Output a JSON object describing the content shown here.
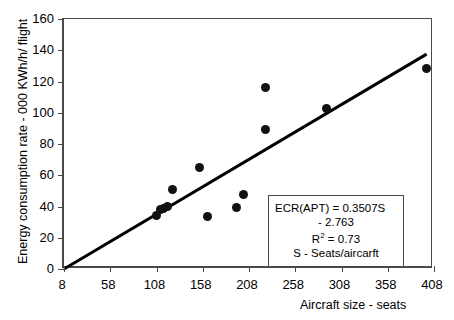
{
  "chart_data": {
    "type": "scatter",
    "title": "",
    "xlabel": "Aircraft size - seats",
    "ylabel": "Energy consumption  rate - 000 KWh/h/ flight",
    "xlim": [
      8,
      408
    ],
    "ylim": [
      0,
      160
    ],
    "xticks": [
      8,
      58,
      108,
      158,
      208,
      258,
      308,
      358,
      408
    ],
    "yticks": [
      0,
      20,
      40,
      60,
      80,
      100,
      120,
      140,
      160
    ],
    "grid": false,
    "legend": "none",
    "marker_color": "#111111",
    "line_color": "#000000",
    "frame_color": "#4a4a4a",
    "points": [
      {
        "x": 108,
        "y": 34.5
      },
      {
        "x": 112,
        "y": 38.0
      },
      {
        "x": 116,
        "y": 38.5
      },
      {
        "x": 120,
        "y": 40.0
      },
      {
        "x": 125,
        "y": 51.0
      },
      {
        "x": 155,
        "y": 65.0
      },
      {
        "x": 163,
        "y": 33.5
      },
      {
        "x": 195,
        "y": 39.5
      },
      {
        "x": 202,
        "y": 48.0
      },
      {
        "x": 226,
        "y": 116.0
      },
      {
        "x": 226,
        "y": 89.0
      },
      {
        "x": 292,
        "y": 103.0
      },
      {
        "x": 400,
        "y": 128.5
      }
    ],
    "trendline": {
      "slope": 0.3507,
      "intercept": -2.763,
      "x_start": 8,
      "x_end": 400
    },
    "annotation": {
      "line1": "ECR(APT) = 0.3507S",
      "line2": "- 2.763",
      "line3_prefix": "R",
      "line3_sup": "2",
      "line3_suffix": " = 0.73",
      "line4": "S - Seats/aircarft"
    }
  }
}
